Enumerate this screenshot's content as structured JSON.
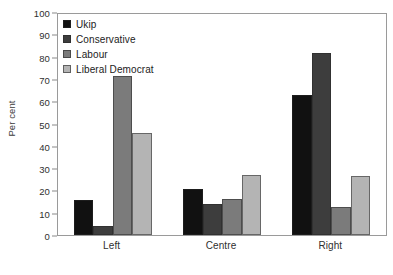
{
  "chart_data": {
    "type": "bar",
    "title": "",
    "xlabel": "",
    "ylabel": "Per cent",
    "ylim": [
      0,
      100
    ],
    "ytick_step": 10,
    "yticks": [
      0,
      10,
      20,
      30,
      40,
      50,
      60,
      70,
      80,
      90,
      100
    ],
    "ytick_labels": [
      "0",
      "10",
      "20",
      "30",
      "40",
      "50",
      "60",
      "70",
      "80",
      "90",
      "100"
    ],
    "categories": [
      "Left",
      "Centre",
      "Right"
    ],
    "grid": false,
    "legend_position": "top-left",
    "series": [
      {
        "name": "Ukip",
        "color": "#111111",
        "values": [
          16,
          21,
          63.5
        ]
      },
      {
        "name": "Conservative",
        "color": "#3d3d3d",
        "values": [
          4,
          14,
          82.5
        ]
      },
      {
        "name": "Labour",
        "color": "#7b7b7b",
        "values": [
          72,
          16.5,
          12.5
        ]
      },
      {
        "name": "Liberal Democrat",
        "color": "#b4b4b4",
        "values": [
          46,
          27,
          26.5
        ]
      }
    ]
  }
}
